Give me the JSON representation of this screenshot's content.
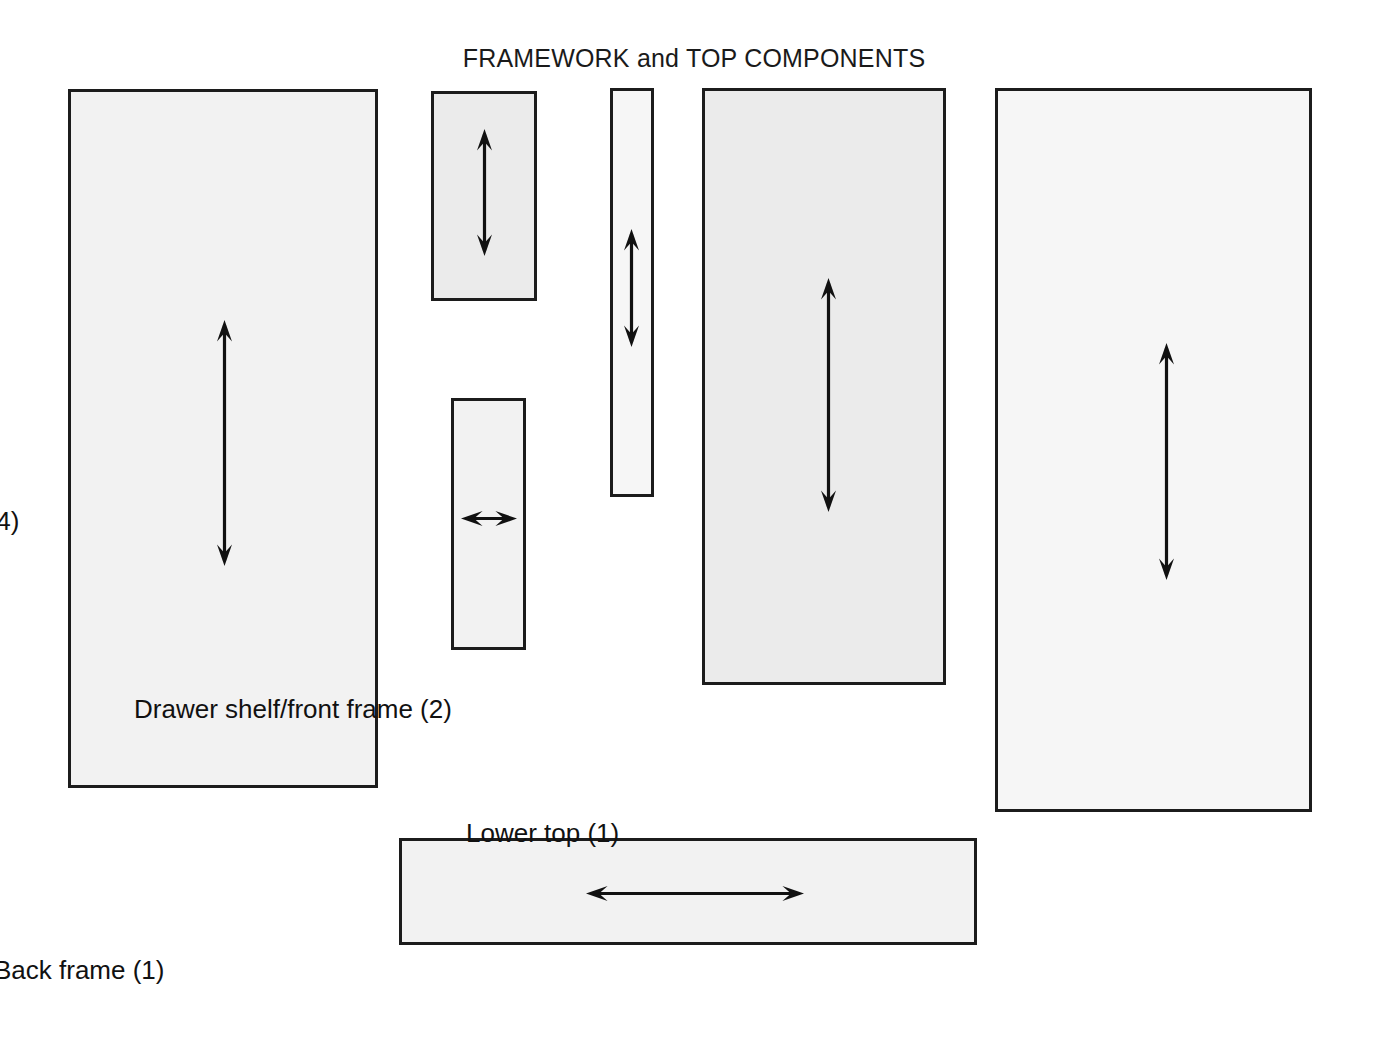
{
  "title": "FRAMEWORK and TOP COMPONENTS",
  "style": {
    "page_background": "#ffffff",
    "panel_fill": "#eeeeee",
    "panel_border": "#1c1c1c",
    "arrow_color": "#111111",
    "text_color": "#111111"
  },
  "parts": [
    {
      "id": "upper-top",
      "label": "Upper top (1)",
      "name": "Upper top",
      "quantity": 1,
      "arrow_direction": "vertical",
      "rect": {
        "x": 68,
        "y": 89,
        "w": 310,
        "h": 699
      },
      "arrow": {
        "cx": 224,
        "y1": 320,
        "y2": 566
      },
      "label_pos": {
        "cx": 224,
        "y": 796
      }
    },
    {
      "id": "side-frame",
      "label": "Side frame (2)",
      "name": "Side frame",
      "quantity": 2,
      "arrow_direction": "vertical",
      "rect": {
        "x": 431,
        "y": 91,
        "w": 106,
        "h": 210
      },
      "arrow": {
        "cx": 484,
        "y1": 129,
        "y2": 256
      },
      "label_pos": {
        "cx": 484,
        "y": 310
      }
    },
    {
      "id": "leg",
      "label": "Leg (4)",
      "name": "Leg",
      "quantity": 4,
      "arrow_direction": "vertical",
      "rect": {
        "x": 610,
        "y": 88,
        "w": 44,
        "h": 409
      },
      "arrow": {
        "cx": 631,
        "y1": 229,
        "y2": 347
      },
      "label_pos": {
        "cx": 631,
        "y": 506
      }
    },
    {
      "id": "divider",
      "label": "Divider (2)",
      "name": "Divider",
      "quantity": 2,
      "arrow_direction": "horizontal",
      "rect": {
        "x": 451,
        "y": 398,
        "w": 75,
        "h": 252
      },
      "arrow": {
        "cy": 518,
        "x1": 461,
        "x2": 517
      },
      "label_pos": {
        "cx": 490,
        "y": 659
      }
    },
    {
      "id": "drawer-shelf-front-frame",
      "label": "Drawer shelf/front frame (2)",
      "name": "Drawer shelf/front frame",
      "quantity": 2,
      "arrow_direction": "vertical",
      "rect": {
        "x": 702,
        "y": 88,
        "w": 244,
        "h": 597
      },
      "arrow": {
        "cx": 828,
        "y1": 278,
        "y2": 512
      },
      "label_pos": {
        "cx": 828,
        "y": 694
      }
    },
    {
      "id": "lower-top",
      "label": "Lower top (1)",
      "name": "Lower top",
      "quantity": 1,
      "arrow_direction": "vertical",
      "rect": {
        "x": 995,
        "y": 88,
        "w": 317,
        "h": 724
      },
      "arrow": {
        "cx": 1166,
        "y1": 343,
        "y2": 580
      },
      "label_pos": {
        "cx": 1160,
        "y": 818
      }
    },
    {
      "id": "back-frame",
      "label": "Back frame (1)",
      "name": "Back frame",
      "quantity": 1,
      "arrow_direction": "horizontal",
      "rect": {
        "x": 399,
        "y": 838,
        "w": 578,
        "h": 107
      },
      "arrow": {
        "cy": 893,
        "x1": 586,
        "x2": 804
      },
      "label_pos": {
        "cx": 688,
        "y": 955
      }
    }
  ]
}
